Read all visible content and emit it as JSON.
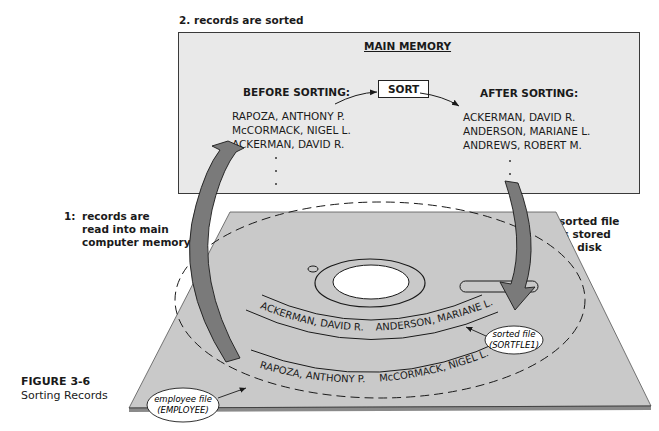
{
  "figure": {
    "number": "FIGURE 3-6",
    "title": "Sorting Records"
  },
  "steps": [
    {
      "num": "1:",
      "lines": [
        "records are",
        "read into main",
        "computer memory"
      ]
    },
    {
      "num": "2.",
      "lines": [
        "records are sorted"
      ]
    },
    {
      "num": "3:",
      "lines": [
        "sorted file",
        "is stored",
        "on disk"
      ]
    }
  ],
  "main_memory": {
    "title": "MAIN MEMORY",
    "before_heading": "BEFORE SORTING:",
    "after_heading": "AFTER SORTING:",
    "sort_label": "SORT",
    "before_records": [
      "RAPOZA, ANTHONY P.",
      "McCORMACK, NIGEL L.",
      "ACKERMAN, DAVID R."
    ],
    "after_records": [
      "ACKERMAN, DAVID R.",
      "ANDERSON, MARIANE L.",
      "ANDREWS, ROBERT M."
    ],
    "ellipsis": "·"
  },
  "disk": {
    "sorted_track": [
      "ACKERMAN, DAVID R.",
      "ANDERSON, MARIANE L."
    ],
    "employee_track": [
      "RAPOZA, ANTHONY P.",
      "McCORMACK, NIGEL L."
    ],
    "sorted_file_label": [
      "sorted file",
      "(SORTFLE1)"
    ],
    "employee_file_label": [
      "employee file",
      "(EMPLOYEE)"
    ]
  },
  "colors": {
    "memory_fill": "#e9e9e9",
    "platter_fill": "#c9c9c9",
    "arrow_fill": "#7a7a7a",
    "line": "#1a1a1a"
  }
}
